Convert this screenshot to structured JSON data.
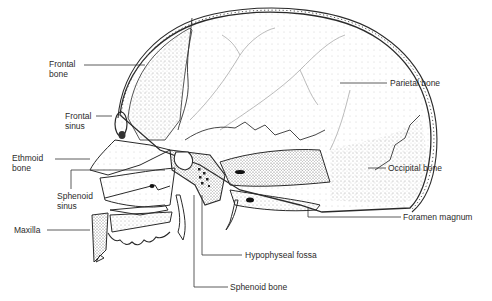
{
  "diagram": {
    "labels": {
      "frontal_bone": [
        "Frontal",
        "bone"
      ],
      "frontal_sinus": [
        "Frontal",
        "sinus"
      ],
      "ethmoid_bone": [
        "Ethmoid",
        "bone"
      ],
      "sphenoid_sinus": [
        "Sphenoid",
        "sinus"
      ],
      "maxilla": "Maxilla",
      "parietal_bone": "Parietal bone",
      "occipital_bone": "Occipital bone",
      "foramen_magnum": "Foramen magnum",
      "hypophyseal_fossa": "Hypophyseal fossa",
      "sphenoid_bone": "Sphenoid bone"
    },
    "colors": {
      "ink": "#2a2a2a",
      "stipple": "#5a5a5a",
      "background": "#ffffff"
    }
  }
}
